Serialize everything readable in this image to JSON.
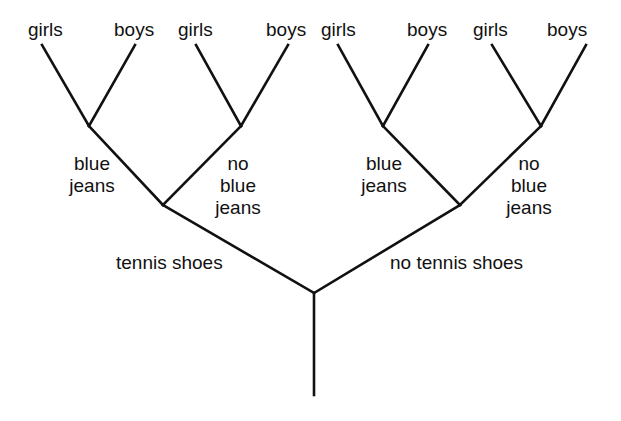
{
  "diagram": {
    "type": "tree",
    "colors": {
      "line": "#111111",
      "background": "#ffffff"
    },
    "root": {
      "children": [
        {
          "edge_label": "tennis shoes",
          "children": [
            {
              "edge_label_lines": [
                "blue",
                "jeans"
              ],
              "leaves": [
                "girls",
                "boys"
              ]
            },
            {
              "edge_label_lines": [
                "no",
                "blue",
                "jeans"
              ],
              "leaves": [
                "girls",
                "boys"
              ]
            }
          ]
        },
        {
          "edge_label": "no tennis shoes",
          "children": [
            {
              "edge_label_lines": [
                "blue",
                "jeans"
              ],
              "leaves": [
                "girls",
                "boys"
              ]
            },
            {
              "edge_label_lines": [
                "no",
                "blue",
                "jeans"
              ],
              "leaves": [
                "girls",
                "boys"
              ]
            }
          ]
        }
      ]
    },
    "labels": {
      "level1": [
        "tennis shoes",
        "no tennis shoes"
      ],
      "level2": {
        "ts_bj": [
          "blue",
          "jeans"
        ],
        "ts_nbj": [
          "no",
          "blue",
          "jeans"
        ],
        "nts_bj": [
          "blue",
          "jeans"
        ],
        "nts_nbj": [
          "no",
          "blue",
          "jeans"
        ]
      },
      "leaves": [
        "girls",
        "boys",
        "girls",
        "boys",
        "girls",
        "boys",
        "girls",
        "boys"
      ]
    }
  }
}
